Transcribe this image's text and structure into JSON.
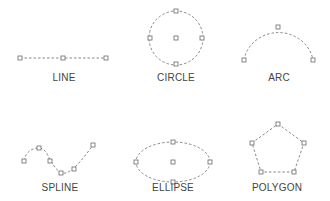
{
  "colors": {
    "stroke": "#7a7a7a",
    "handle": "#6a6a6a",
    "label": "#444444",
    "background": "#ffffff"
  },
  "shapes": [
    {
      "id": "line",
      "label": "LINE"
    },
    {
      "id": "circle",
      "label": "CIRCLE"
    },
    {
      "id": "arc",
      "label": "ARC"
    },
    {
      "id": "spline",
      "label": "SPLINE"
    },
    {
      "id": "ellipse",
      "label": "ELLIPSE"
    },
    {
      "id": "polygon",
      "label": "POLYGON"
    }
  ]
}
